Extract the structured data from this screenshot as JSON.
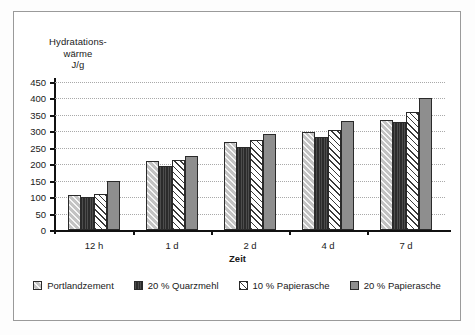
{
  "frame": {
    "present": true
  },
  "chart_data": {
    "type": "bar",
    "title": "",
    "ylabel_lines": [
      "Hydratations-",
      "wärme",
      "J/g"
    ],
    "xlabel": "Zeit",
    "categories": [
      "12 h",
      "1 d",
      "2 d",
      "4 d",
      "7 d"
    ],
    "ylim": [
      0,
      450
    ],
    "yticks": [
      0,
      50,
      100,
      150,
      200,
      250,
      300,
      350,
      400,
      450
    ],
    "ytick_labels": [
      "0",
      "50",
      "100",
      "150",
      "200",
      "250",
      "300",
      "350",
      "400",
      "450"
    ],
    "grid": true,
    "legend_position": "bottom",
    "series": [
      {
        "name": "Portlandzement",
        "fill": "light-grey-diagonal-hatch",
        "color": "#c3c3c3",
        "values": [
          107,
          211,
          268,
          299,
          335
        ]
      },
      {
        "name": "20 % Quarzmehl",
        "fill": "dark-solid-vertical-lines",
        "color": "#2b2b2b",
        "values": [
          100,
          196,
          251,
          282,
          327
        ]
      },
      {
        "name": "10 % Papierasche",
        "fill": "white-diagonal-hatch",
        "color": "#ffffff",
        "values": [
          110,
          212,
          275,
          303,
          358
        ]
      },
      {
        "name": "20 % Papierasche",
        "fill": "medium-grey-solid",
        "color": "#8e8e8e",
        "values": [
          149,
          226,
          292,
          332,
          400
        ]
      }
    ]
  },
  "legend": {
    "items": [
      {
        "label": "Portlandzement"
      },
      {
        "label": "20 % Quarzmehl"
      },
      {
        "label": "10 % Papierasche"
      },
      {
        "label": "20 % Papierasche"
      }
    ]
  }
}
